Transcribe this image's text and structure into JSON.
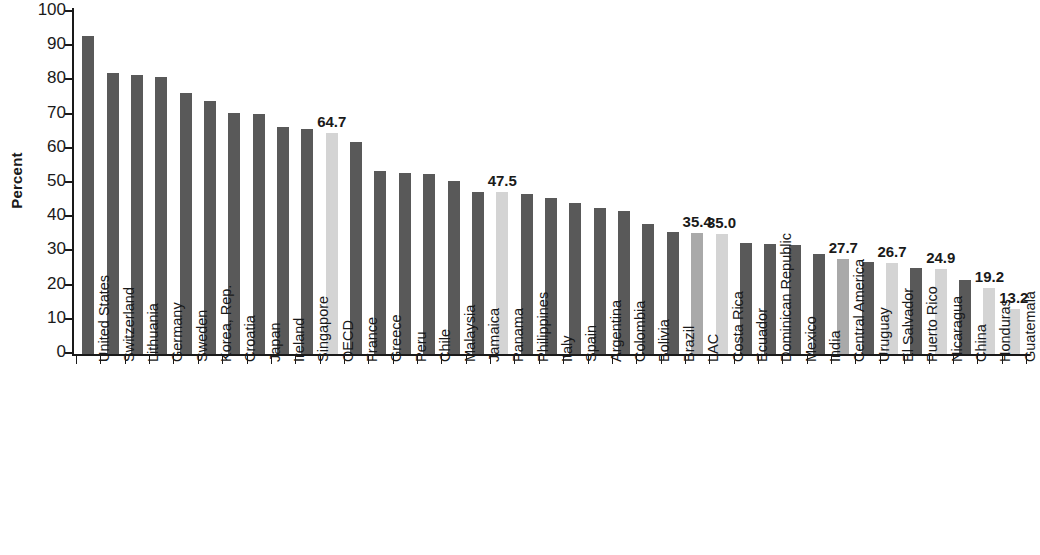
{
  "chart_data": {
    "type": "bar",
    "title": "",
    "subtitle": "",
    "xlabel": "",
    "ylabel": "Percent",
    "ylim": [
      0,
      100
    ],
    "yticks": [
      0,
      10,
      20,
      30,
      40,
      50,
      60,
      70,
      80,
      90,
      100
    ],
    "grid": false,
    "legend": null,
    "orientation": "vertical",
    "categories": [
      "United States",
      "Switzerland",
      "Lithuania",
      "Germany",
      "Sweden",
      "Korea, Rep.",
      "Croatia",
      "Japan",
      "Ireland",
      "Singapore",
      "OECD",
      "France",
      "Greece",
      "Peru",
      "Chile",
      "Malaysia",
      "Jamaica",
      "Panama",
      "Philippines",
      "Italy",
      "Spain",
      "Argentina",
      "Colombia",
      "Bolivia",
      "Brazil",
      "LAC",
      "Costa Rica",
      "Ecuador",
      "Dominican Republic",
      "Mexico",
      "India",
      "Central America",
      "Uruguay",
      "El Salvador",
      "Puerto Rico",
      "Nicaragua",
      "China",
      "Honduras",
      "Guatemala"
    ],
    "values": [
      93.0,
      82.2,
      81.6,
      81.0,
      76.2,
      74.0,
      70.5,
      70.2,
      66.3,
      65.8,
      64.7,
      62.0,
      53.6,
      52.8,
      52.5,
      50.7,
      47.3,
      47.5,
      46.7,
      45.6,
      44.2,
      42.7,
      41.7,
      38.0,
      35.8,
      35.4,
      35.0,
      32.6,
      32.2,
      32.0,
      29.2,
      27.7,
      26.8,
      26.7,
      25.2,
      24.9,
      21.5,
      19.2,
      13.2
    ],
    "bar_styles": [
      "dark",
      "dark",
      "dark",
      "dark",
      "dark",
      "dark",
      "dark",
      "dark",
      "dark",
      "dark",
      "light",
      "dark",
      "dark",
      "dark",
      "dark",
      "dark",
      "dark",
      "light",
      "dark",
      "dark",
      "dark",
      "dark",
      "dark",
      "dark",
      "dark",
      "medium",
      "light",
      "dark",
      "dark",
      "dark",
      "dark",
      "medium",
      "dark",
      "light",
      "dark",
      "light",
      "dark",
      "light",
      "light"
    ],
    "value_labels": {
      "OECD": "64.7",
      "Panama": "47.5",
      "LAC": "35.4",
      "Costa Rica": "35.0",
      "Central America": "27.7",
      "El Salvador": "26.7",
      "Nicaragua": "24.9",
      "Honduras": "19.2",
      "Guatemala": "13.2"
    },
    "colors": {
      "dark": "#595959",
      "medium": "#a9a9a9",
      "light": "#d4d4d4",
      "axis": "#1a1a1a",
      "text": "#1a1a1a",
      "background": "#ffffff"
    }
  }
}
